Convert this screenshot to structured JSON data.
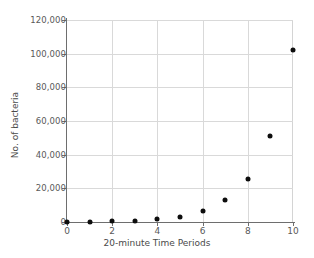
{
  "chart_data": {
    "type": "scatter",
    "title": "",
    "xlabel": "20-minute Time Periods",
    "ylabel": "No. of bacteria",
    "x": [
      0,
      1,
      2,
      3,
      4,
      5,
      6,
      7,
      8,
      9,
      10
    ],
    "values": [
      100,
      200,
      400,
      800,
      1600,
      3200,
      6400,
      12800,
      25600,
      51200,
      102400
    ],
    "xlim": [
      0,
      10
    ],
    "ylim": [
      0,
      120000
    ],
    "xticks": [
      0,
      2,
      4,
      6,
      8,
      10
    ],
    "xtick_labels": [
      "0",
      "2",
      "4",
      "6",
      "8",
      "10"
    ],
    "yticks": [
      0,
      20000,
      40000,
      60000,
      80000,
      100000,
      120000
    ],
    "ytick_labels": [
      "0",
      "20,000",
      "40,000",
      "60,000",
      "80,000",
      "100,000",
      "120,000"
    ],
    "grid": true,
    "legend": false,
    "marker_color": "#0d0d0d",
    "grid_color": "#d9d9d9",
    "axis_color": "#6e6e6e"
  }
}
